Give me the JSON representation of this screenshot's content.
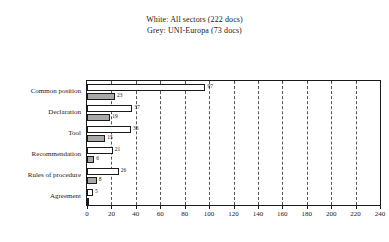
{
  "legend": {
    "line1": "White: All sectors (222 docs)",
    "line2": "Grey: UNI-Europa (73 docs)"
  },
  "chart_data": {
    "type": "bar",
    "orientation": "horizontal",
    "title": "",
    "xlabel": "",
    "ylabel": "",
    "xlim": [
      0,
      240
    ],
    "xticks": [
      0,
      20,
      40,
      60,
      80,
      100,
      120,
      140,
      160,
      180,
      200,
      220,
      240
    ],
    "grid": true,
    "grid_style": "dashed-vertical",
    "legend_position": "above-plot",
    "categories": [
      "Common position",
      "Declaration",
      "Tool",
      "Recommendation",
      "Rules of procedure",
      "Agreement"
    ],
    "series": [
      {
        "name": "All sectors",
        "fill": "white",
        "color": "#ffffff",
        "values": [
          97,
          37,
          36,
          21,
          26,
          5
        ]
      },
      {
        "name": "UNI-Europa",
        "fill": "grey",
        "color": "#a8a8a8",
        "values": [
          23,
          19,
          15,
          6,
          8,
          0
        ]
      }
    ]
  }
}
